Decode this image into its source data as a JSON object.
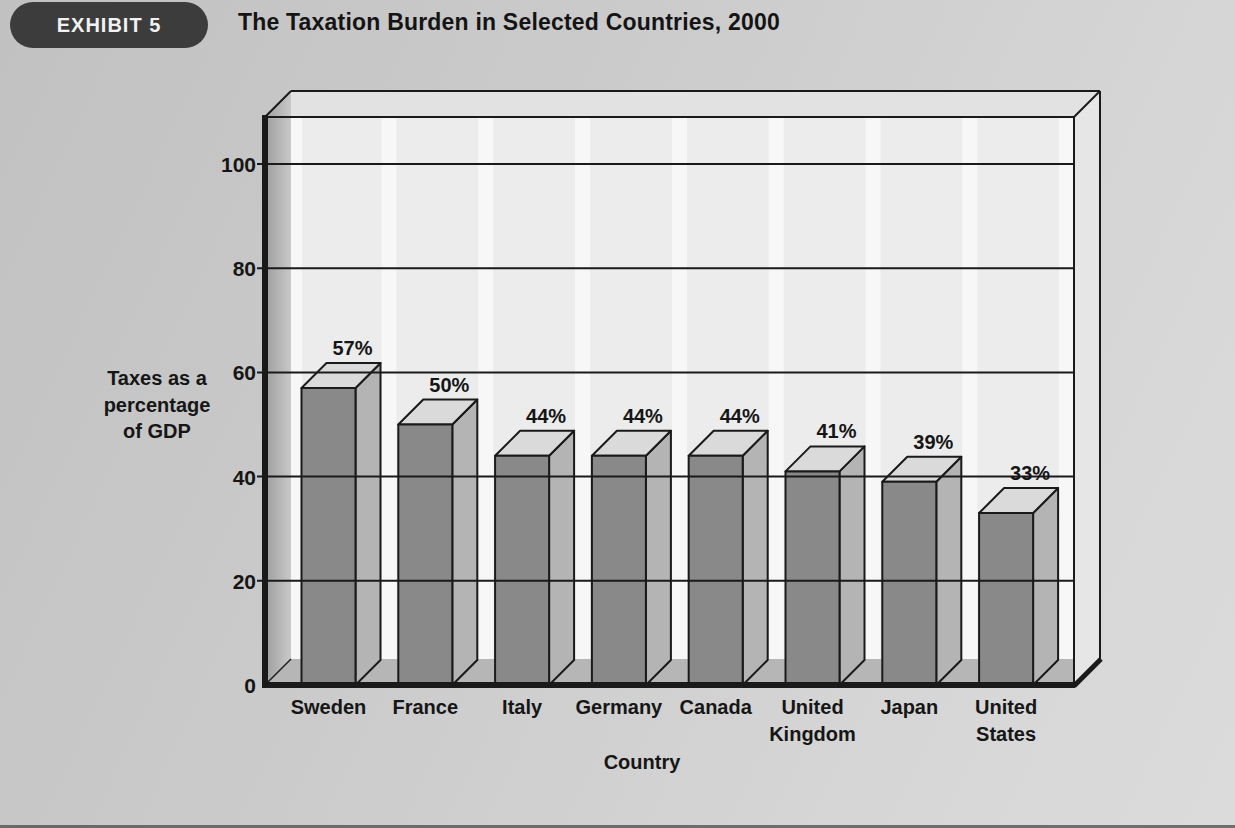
{
  "exhibit": {
    "badge": "EXHIBIT 5",
    "title": "The Taxation Burden in Selected Countries, 2000"
  },
  "chart_data": {
    "type": "bar",
    "style": "3d-block-bars",
    "title": "The Taxation Burden in Selected Countries, 2000",
    "categories": [
      "Sweden",
      "France",
      "Italy",
      "Germany",
      "Canada",
      "United Kingdom",
      "Japan",
      "United States"
    ],
    "values": [
      57,
      50,
      44,
      44,
      44,
      41,
      39,
      33
    ],
    "value_labels": [
      "57%",
      "50%",
      "44%",
      "44%",
      "44%",
      "41%",
      "39%",
      "33%"
    ],
    "xlabel": "Country",
    "ylabel": "Taxes as a percentage of GDP",
    "ylabel_lines": [
      "Taxes as a",
      "percentage",
      "of GDP"
    ],
    "yticks": [
      0,
      20,
      40,
      60,
      80,
      100
    ],
    "ylim": [
      0,
      100
    ],
    "grid": true,
    "legend": false,
    "unit": "percent of GDP"
  },
  "colors": {
    "badge_bg": "#3c3c3c",
    "badge_text": "#f2f2f2",
    "title_text": "#141414",
    "bar_front": "#898989",
    "bar_side": "#b4b4b4",
    "bar_top": "#dadada",
    "wall_back": "#ececec",
    "wall_back_highlight": "#f8f8f8",
    "wall_left": "#9e9e9e",
    "wall_left_light": "#c9c9c9",
    "wall_right": "#e6e6e6",
    "box_top": "#e2e2e2",
    "floor": "#b6b6b6",
    "line": "#1a1a1a",
    "label_text": "#161616"
  }
}
